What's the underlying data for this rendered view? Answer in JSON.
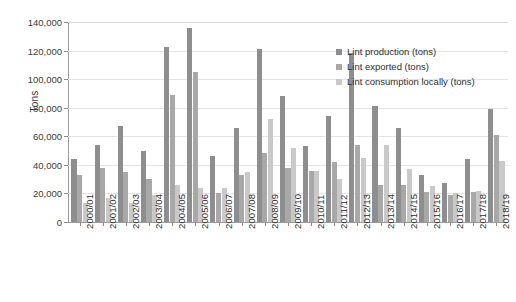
{
  "chart_data": {
    "type": "bar",
    "title": "",
    "xlabel": "",
    "ylabel": "Tons",
    "ylim": [
      0,
      140000
    ],
    "ytick_step": 20000,
    "grid": true,
    "legend_position": "top-right",
    "categories": [
      "2000/01",
      "2001/02",
      "2002/03",
      "2003/04",
      "2004/05",
      "2005/06",
      "2006/07",
      "2007/08",
      "2008/09",
      "2009/10",
      "2010/11",
      "2011/12",
      "2012/13",
      "2013/14",
      "2014/15",
      "2015/16",
      "2016/17",
      "2017/18",
      "2018/19"
    ],
    "ytick_labels": [
      "0",
      "20,000",
      "40,000",
      "60,000",
      "80,000",
      "100,000",
      "120,000",
      "140,000"
    ],
    "ytick_values": [
      0,
      20000,
      40000,
      60000,
      80000,
      100000,
      120000,
      140000
    ],
    "series": [
      {
        "name": "Lint production (tons)",
        "color": "#8e8e8e",
        "values": [
          44000,
          54000,
          67000,
          50000,
          122500,
          135500,
          46000,
          66000,
          121000,
          88000,
          53000,
          74000,
          118000,
          81000,
          66000,
          33000,
          27000,
          44000,
          79000
        ]
      },
      {
        "name": "Lint exported (tons)",
        "color": "#a8a8a8",
        "values": [
          33000,
          38000,
          35000,
          30000,
          89000,
          105000,
          20000,
          33000,
          48000,
          38000,
          36000,
          42000,
          54000,
          26000,
          26000,
          21000,
          19000,
          21000,
          61000
        ]
      },
      {
        "name": "Lint consumption locally (tons)",
        "color": "#c9c9c9",
        "values": [
          13000,
          17000,
          13000,
          19000,
          26000,
          24000,
          24000,
          35000,
          72000,
          52000,
          36000,
          30000,
          45000,
          54000,
          37000,
          25000,
          20000,
          22000,
          43000
        ]
      }
    ]
  },
  "caption": {
    "text": ""
  }
}
